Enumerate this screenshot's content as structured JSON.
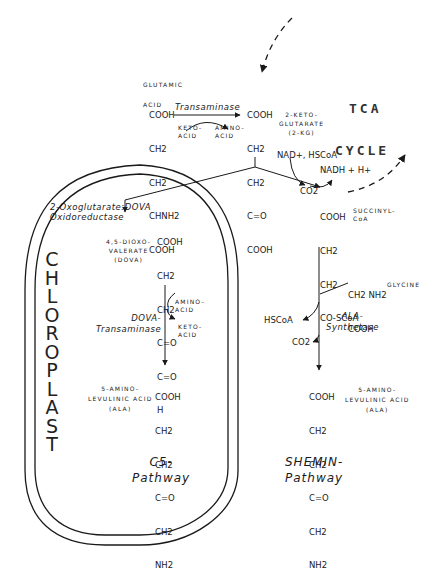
{
  "tca": {
    "line1": "TCA",
    "line2": "CYCLE"
  },
  "compartment": {
    "label_letters": [
      "C",
      "H",
      "L",
      "O",
      "R",
      "O",
      "P",
      "L",
      "A",
      "S",
      "T"
    ]
  },
  "glutamic_acid": {
    "label1": "GLUTAMIC",
    "label2": "ACID",
    "structure": [
      "COOH",
      "CH2",
      "CH2",
      "CHNH2",
      "COOH"
    ]
  },
  "transaminase": {
    "enzyme": "Transaminase",
    "keto_acid": "KETO-\nACID",
    "amino_acid": "AMINO-\nACID"
  },
  "ketoglutarate": {
    "label": "2-KETO-\nGLUTARATE\n(2-KG)",
    "structure": [
      "COOH",
      "CH2",
      "CH2",
      "C=O",
      "COOH"
    ]
  },
  "decarboxylation": {
    "cofactors_in": "NAD+, HSCoA",
    "co2": "CO2",
    "cofactors_out": "NADH + H+"
  },
  "succinyl_coa": {
    "label": "SUCCINYL-\nCoA",
    "structure": [
      "COOH",
      "CH2",
      "CH2",
      "CO-SCoA"
    ]
  },
  "c5_pathway": {
    "enzyme1": "2-Oxoglutarate:DOVA\nOxidoreductase",
    "dova_label": "4,5-DIOXO-\nVALERATE\n(DOVA)",
    "dova_structure": [
      "COOH",
      "CH2",
      "CH2",
      "C=O",
      "C=O",
      "H"
    ],
    "enzyme2": "DOVA-\nTransaminase",
    "amino_acid": "AMINO-\nACID",
    "keto_acid": "KETO-\nACID",
    "ala_label": "5-AMINO-\nLEVULINIC ACID\n(ALA)",
    "ala_structure": [
      "COOH",
      "CH2",
      "CH2",
      "C=O",
      "CH2",
      "NH2"
    ],
    "title": "C5-\nPathway"
  },
  "shemin_pathway": {
    "glycine_structure": [
      "CH2 NH2",
      "COOH"
    ],
    "glycine_label": "GLYCINE",
    "enzyme": "ALA-\nSynthetase",
    "hscoa": "HSCoA",
    "co2": "CO2",
    "ala_label": "5-AMINO-\nLEVULINIC ACID\n(ALA)",
    "ala_structure": [
      "COOH",
      "CH2",
      "CH2",
      "C=O",
      "CH2",
      "NH2"
    ],
    "title": "SHEMIN-\nPathway"
  }
}
